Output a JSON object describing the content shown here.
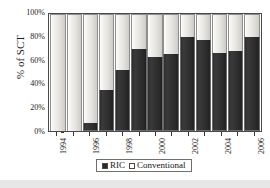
{
  "chart_data": {
    "type": "bar",
    "subtype": "100% stacked column",
    "title": "",
    "xlabel": "",
    "ylabel": "% of SCT",
    "ylim": [
      0,
      100
    ],
    "ytick_labels": [
      "100%",
      "80%",
      "60%",
      "40%",
      "20%",
      "0%"
    ],
    "ytick_values": [
      100,
      80,
      60,
      40,
      20,
      0
    ],
    "grid": false,
    "legend_position": "bottom-center",
    "categories": [
      "1994",
      "1995",
      "1996",
      "1997",
      "1998",
      "1999",
      "2000",
      "2001",
      "2002",
      "2003",
      "2004",
      "2005",
      "2006"
    ],
    "visible_tick_labels": [
      "1994",
      "",
      "1996",
      "",
      "1998",
      "",
      "2000",
      "",
      "2002",
      "",
      "2004",
      "",
      "2006"
    ],
    "series": [
      {
        "name": "RIC",
        "color": "#2b2a2a",
        "values": [
          0,
          0,
          7,
          35,
          52,
          70,
          63,
          66,
          80,
          78,
          67,
          68,
          80
        ]
      },
      {
        "name": "Conventional",
        "color": "#ffffff",
        "values": [
          100,
          100,
          93,
          65,
          48,
          30,
          37,
          34,
          20,
          22,
          33,
          32,
          20
        ]
      }
    ]
  },
  "legend": {
    "items": [
      {
        "label": "RIC",
        "swatch": "filled-square-icon"
      },
      {
        "label": "Conventional",
        "swatch": "empty-square-icon"
      }
    ]
  },
  "axes": {
    "y_title": "% of SCT"
  }
}
